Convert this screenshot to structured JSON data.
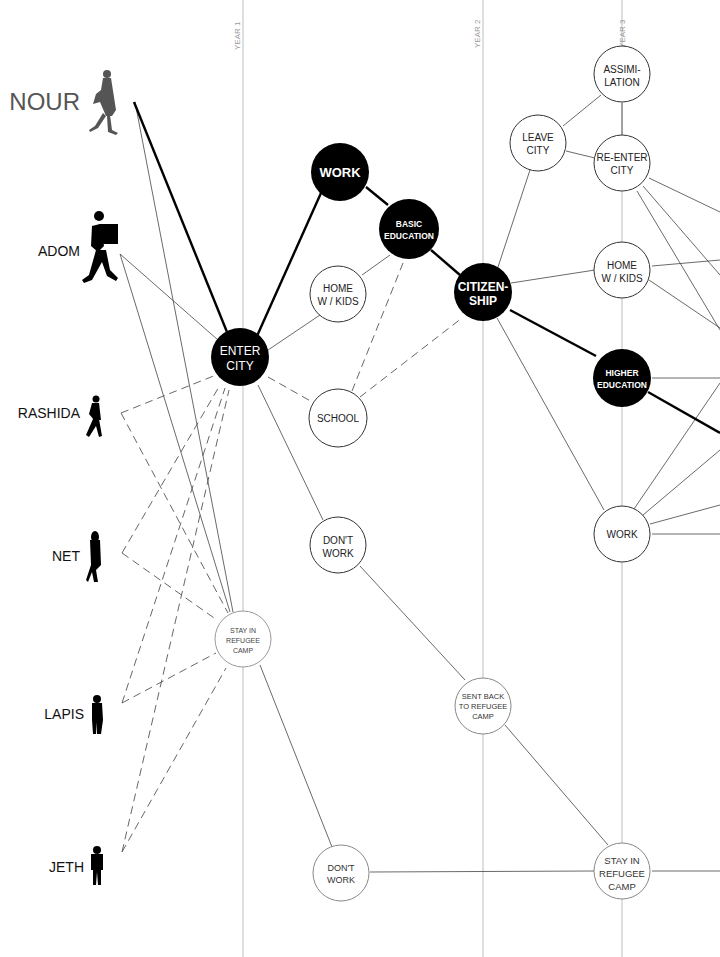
{
  "diagram": {
    "type": "life-path decision network",
    "years": [
      {
        "id": "year1",
        "label": "YEAR 1",
        "x": 243
      },
      {
        "id": "year2",
        "label": "YEAR 2",
        "x": 483
      },
      {
        "id": "year3",
        "label": "YEAR 3",
        "x": 622
      }
    ],
    "people": [
      {
        "id": "nour",
        "label": "NOUR",
        "y": 102,
        "highlight": true
      },
      {
        "id": "adom",
        "label": "ADOM",
        "y": 250
      },
      {
        "id": "rashida",
        "label": "RASHIDA",
        "y": 413
      },
      {
        "id": "net",
        "label": "NET",
        "y": 555
      },
      {
        "id": "lapis",
        "label": "LAPIS",
        "y": 714
      },
      {
        "id": "jeth",
        "label": "JETH",
        "y": 866
      }
    ],
    "nodes": [
      {
        "id": "enter-city",
        "lines": [
          "ENTER",
          "CITY"
        ],
        "filled": true
      },
      {
        "id": "work-1",
        "lines": [
          "WORK"
        ],
        "filled": true
      },
      {
        "id": "basic-education",
        "lines": [
          "BASIC",
          "EDUCATION"
        ],
        "filled": true
      },
      {
        "id": "citizenship",
        "lines": [
          "CITIZEN-",
          "SHIP"
        ],
        "filled": true
      },
      {
        "id": "higher-education",
        "lines": [
          "HIGHER",
          "EDUCATION"
        ],
        "filled": true
      },
      {
        "id": "home-kids-1",
        "lines": [
          "HOME",
          "W / KIDS"
        ],
        "filled": false
      },
      {
        "id": "school",
        "lines": [
          "SCHOOL"
        ],
        "filled": false
      },
      {
        "id": "dont-work-1",
        "lines": [
          "DON'T",
          "WORK"
        ],
        "filled": false
      },
      {
        "id": "stay-camp-1",
        "lines": [
          "STAY IN",
          "REFUGEE",
          "CAMP"
        ],
        "filled": false
      },
      {
        "id": "sent-back",
        "lines": [
          "SENT BACK",
          "TO REFUGEE",
          "CAMP"
        ],
        "filled": false
      },
      {
        "id": "dont-work-2",
        "lines": [
          "DON'T",
          "WORK"
        ],
        "filled": false
      },
      {
        "id": "assimilation",
        "lines": [
          "ASSIMI-",
          "LATION"
        ],
        "filled": false
      },
      {
        "id": "leave-city",
        "lines": [
          "LEAVE",
          "CITY"
        ],
        "filled": false
      },
      {
        "id": "re-enter-city",
        "lines": [
          "RE-ENTER",
          "CITY"
        ],
        "filled": false
      },
      {
        "id": "home-kids-2",
        "lines": [
          "HOME",
          "W / KIDS"
        ],
        "filled": false
      },
      {
        "id": "work-2",
        "lines": [
          "WORK"
        ],
        "filled": false
      },
      {
        "id": "stay-camp-2",
        "lines": [
          "STAY IN",
          "REFUGEE",
          "CAMP"
        ],
        "filled": false
      }
    ],
    "highlighted_path": [
      "nour",
      "enter-city",
      "work-1",
      "basic-education",
      "citizenship",
      "higher-education"
    ],
    "colors": {
      "filled": "#000000",
      "outline": "#222222",
      "grid": "#b5b5b5",
      "nour": "#555555"
    }
  }
}
